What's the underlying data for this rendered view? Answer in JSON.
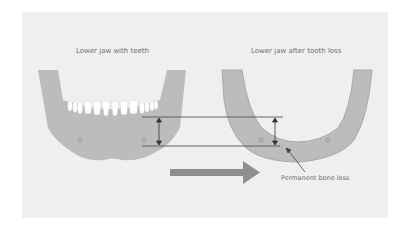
{
  "diagram": {
    "left_title": "Lower jaw with teeth",
    "right_title": "Lower jaw after tooth loss",
    "annotation": "Permanent bone loss",
    "colors": {
      "background": "#ffffff",
      "panel": "#efefef",
      "jaw_fill": "#bcbcbc",
      "jaw_outline": "#a8a8a8",
      "teeth": "#ffffff",
      "lines": "#555555",
      "arrow": "#8f8f8f",
      "text": "#6e6e6e"
    },
    "elements": [
      {
        "type": "jaw",
        "state": "with teeth",
        "position": "left"
      },
      {
        "type": "jaw",
        "state": "after tooth loss",
        "position": "right"
      },
      {
        "type": "reference-lines",
        "count": 2
      },
      {
        "type": "height-indicator",
        "count": 2
      },
      {
        "type": "direction-arrow",
        "direction": "right"
      }
    ]
  }
}
